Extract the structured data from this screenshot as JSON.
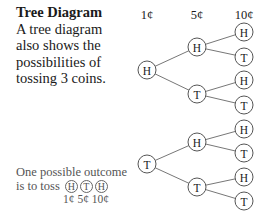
{
  "intro": {
    "title": "Tree Diagram",
    "lines": [
      "A tree diagram",
      "also shows the",
      "possibilities of",
      "tossing 3 coins."
    ]
  },
  "headers": [
    "1¢",
    "5¢",
    "10¢"
  ],
  "tree": {
    "roots": [
      {
        "label": "H",
        "children": [
          {
            "label": "H",
            "children": [
              {
                "label": "H"
              },
              {
                "label": "T"
              }
            ]
          },
          {
            "label": "T",
            "children": [
              {
                "label": "H"
              },
              {
                "label": "T"
              }
            ]
          }
        ]
      },
      {
        "label": "T",
        "children": [
          {
            "label": "H",
            "children": [
              {
                "label": "H"
              },
              {
                "label": "T"
              }
            ]
          },
          {
            "label": "T",
            "children": [
              {
                "label": "H"
              },
              {
                "label": "T"
              }
            ]
          }
        ]
      }
    ]
  },
  "outcome": {
    "line1": "One possible outcome",
    "line2_prefix": "is to toss",
    "sequence": [
      "H",
      "T",
      "H"
    ],
    "coins_label": "1¢ 5¢ 10¢"
  }
}
